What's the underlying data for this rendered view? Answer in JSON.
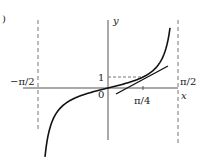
{
  "figure": {
    "panel_label": ")",
    "function": "tan x",
    "x_axis_label": "x",
    "y_axis_label": "y",
    "origin_label": "0",
    "y_tick_label": "1",
    "x_tick_label": "π/4",
    "left_asymptote_label": "−π/2",
    "right_asymptote_label": "π/2",
    "tangent_point": {
      "x": "π/4",
      "y": "1"
    },
    "colors": {
      "curve": "#111111",
      "axis": "#555555",
      "dash": "#666666"
    }
  }
}
